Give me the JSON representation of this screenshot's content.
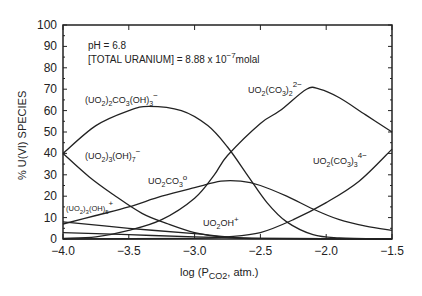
{
  "chart_data": {
    "type": "line",
    "title": "",
    "xlabel": "log (P_CO2, atm.)",
    "ylabel": "% U(VI) SPECIES",
    "xlim": [
      -4.0,
      -1.5
    ],
    "ylim": [
      0,
      100
    ],
    "xticks": [
      -4.0,
      -3.5,
      -3.0,
      -2.5,
      -2.0,
      -1.5
    ],
    "xtick_labels": [
      "−4.0",
      "−3.5",
      "−3.0",
      "−2.5",
      "−2.0",
      "−1.5"
    ],
    "yticks": [
      0,
      10,
      20,
      30,
      40,
      50,
      60,
      70,
      80,
      90,
      100
    ],
    "grid": false,
    "annotations": [
      "pH = 6.8",
      "[TOTAL URANIUM] = 8.88 x 10^-7 molal"
    ],
    "series": [
      {
        "name": "(UO2)2CO3(OH)3-",
        "x": [
          -4.0,
          -3.75,
          -3.5,
          -3.35,
          -3.1,
          -2.9,
          -2.75,
          -2.6,
          -2.45,
          -2.3,
          -2.1,
          -1.9,
          -1.5
        ],
        "values": [
          40,
          53,
          60,
          62,
          60,
          53,
          43,
          30,
          17,
          8,
          2,
          0.5,
          0
        ]
      },
      {
        "name": "(UO2)3(OH)7-",
        "x": [
          -4.0,
          -3.8,
          -3.6,
          -3.4,
          -3.2,
          -3.0,
          -2.8,
          -2.5,
          -1.5
        ],
        "values": [
          40,
          29,
          20,
          12,
          7,
          3,
          1,
          0.3,
          0
        ]
      },
      {
        "name": "UO2CO3°",
        "x": [
          -4.0,
          -3.75,
          -3.5,
          -3.25,
          -3.0,
          -2.8,
          -2.65,
          -2.5,
          -2.3,
          -2.1,
          -1.9,
          -1.7,
          -1.5
        ],
        "values": [
          7,
          11,
          15,
          20,
          24,
          27,
          27,
          25,
          20,
          14,
          9,
          6,
          4
        ]
      },
      {
        "name": "UO2(CO3)2 2-",
        "x": [
          -4.0,
          -3.75,
          -3.5,
          -3.25,
          -3.0,
          -2.85,
          -2.75,
          -2.5,
          -2.35,
          -2.15,
          -2.05,
          -1.9,
          -1.7,
          -1.5
        ],
        "values": [
          0.3,
          1,
          4,
          9,
          19,
          30,
          39,
          54,
          60,
          70,
          70,
          66,
          58,
          50
        ]
      },
      {
        "name": "UO2(CO3)3 4-",
        "x": [
          -4.0,
          -3.0,
          -2.75,
          -2.5,
          -2.25,
          -2.0,
          -1.75,
          -1.5
        ],
        "values": [
          0,
          0.3,
          1,
          3,
          9,
          17,
          27,
          42
        ]
      },
      {
        "name": "(UO2)3(OH)5+",
        "x": [
          -4.0,
          -3.5,
          -3.0,
          -2.75,
          -2.5,
          -1.5
        ],
        "values": [
          8,
          5,
          2.5,
          1,
          0.2,
          0
        ]
      },
      {
        "name": "UO2OH+",
        "x": [
          -4.0,
          -3.5,
          -3.0,
          -2.75,
          -2.5,
          -1.5
        ],
        "values": [
          3,
          2,
          1,
          0.7,
          0.3,
          0
        ]
      }
    ]
  },
  "labels": {
    "ph": "pH = 6.8",
    "total_uranium": "[TOTAL URANIUM] = 8.88 x 10",
    "total_uranium_exp": "−7",
    "total_uranium_unit": "molal",
    "ylabel": "% U(VI) SPECIES",
    "xlabel_log": "log (P",
    "xlabel_sub": "CO2",
    "xlabel_tail": ", atm.)"
  }
}
